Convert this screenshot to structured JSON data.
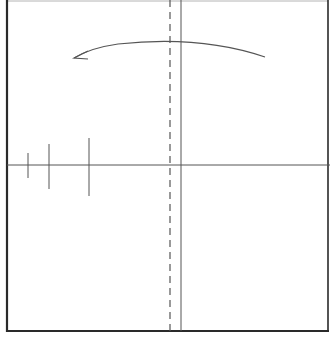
{
  "diagram": {
    "width": 330,
    "height": 352,
    "background": "#ffffff",
    "colors": {
      "border": "#2a2a2a",
      "axis": "#555555",
      "guide": "#555555",
      "arrow": "#555555"
    },
    "frame": {
      "left": 7,
      "top": 1,
      "right": 328,
      "bottom": 331
    },
    "horizontal_axis": {
      "y": 165,
      "x1": 7,
      "x2": 330
    },
    "vertical_solid_line": {
      "x": 181,
      "y1": 0,
      "y2": 331
    },
    "vertical_dashed_line": {
      "x": 170,
      "y1": 0,
      "y2": 331,
      "dash": "7,5"
    },
    "tick_marks": [
      {
        "x": 28,
        "y1": 153,
        "y2": 178
      },
      {
        "x": 49,
        "y1": 144,
        "y2": 189
      },
      {
        "x": 89,
        "y1": 138,
        "y2": 196
      }
    ],
    "curved_arrow": {
      "path": "M 265 57 Q 200 35 118 44 Q 90 48 74 58",
      "head": {
        "tip_x": 74,
        "tip_y": 58
      },
      "direction": "right-to-left"
    }
  }
}
